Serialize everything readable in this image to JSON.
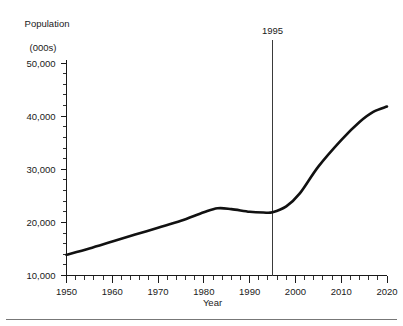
{
  "figure": {
    "y_axis_title_line1": "Population",
    "y_axis_title_line2": "(000s)",
    "x_axis_title": "Year"
  },
  "chart_data": {
    "type": "line",
    "title": "",
    "subtitle": "",
    "xlabel": "Year",
    "ylabel": "Population (000s)",
    "xlim": [
      1950,
      2020
    ],
    "ylim": [
      10000,
      50000
    ],
    "grid": false,
    "legend": null,
    "x_ticks_major": [
      1950,
      1960,
      1970,
      1980,
      1990,
      2000,
      2010,
      2020
    ],
    "x_tick_labels": [
      "1950",
      "1960",
      "1970",
      "1980",
      "1990",
      "2000",
      "2010",
      "2020"
    ],
    "x_minor_tick_interval": 2,
    "y_ticks_major": [
      10000,
      20000,
      30000,
      40000,
      50000
    ],
    "y_tick_labels": [
      "10,000",
      "20,000",
      "30,000",
      "40,000",
      "50,000"
    ],
    "y_minor_tick_interval": 2000,
    "series": [
      {
        "name": "Population",
        "color": "#111111",
        "x": [
          1950,
          1955,
          1960,
          1965,
          1970,
          1975,
          1980,
          1983,
          1986,
          1990,
          1993,
          1995,
          1998,
          2001,
          2005,
          2010,
          2014,
          2017,
          2020
        ],
        "values": [
          13900,
          15100,
          16400,
          17700,
          19000,
          20300,
          21900,
          22650,
          22500,
          22000,
          21850,
          21900,
          23000,
          25500,
          30500,
          35500,
          38900,
          40800,
          41800
        ]
      }
    ],
    "annotations": [
      {
        "label": "1995",
        "type": "vertical-line",
        "x": 1995,
        "y_top": 50000,
        "y_bottom": 10000
      }
    ]
  }
}
